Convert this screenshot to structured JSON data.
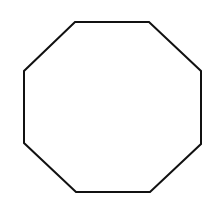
{
  "figure": {
    "shape": "octagon",
    "width": 210,
    "height": 199,
    "background": "#ffffff",
    "stroke": "#111111",
    "stroke_width": 2,
    "fill": "#ffffff",
    "points": "75,22 149,22 201,71 201,144 150,192 76,192 24,143 24,71"
  }
}
